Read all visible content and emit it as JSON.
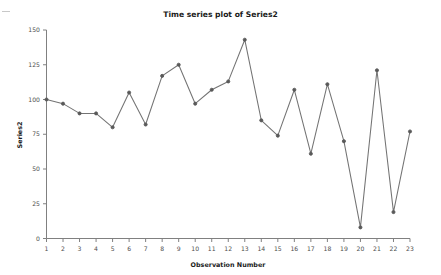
{
  "chart_data": {
    "type": "line",
    "title": "Time series plot of Series2",
    "xlabel": "Observation Number",
    "ylabel": "Series2",
    "x": [
      1,
      2,
      3,
      4,
      5,
      6,
      7,
      8,
      9,
      10,
      11,
      12,
      13,
      14,
      15,
      16,
      17,
      18,
      19,
      20,
      21,
      22,
      23
    ],
    "values": [
      100,
      97,
      90,
      90,
      80,
      105,
      82,
      117,
      125,
      97,
      107,
      113,
      143,
      85,
      74,
      107,
      61,
      111,
      70,
      8,
      121,
      19,
      77
    ],
    "series": [
      {
        "name": "Series2",
        "values": [
          100,
          97,
          90,
          90,
          80,
          105,
          82,
          117,
          125,
          97,
          107,
          113,
          143,
          85,
          74,
          107,
          61,
          111,
          70,
          8,
          121,
          19,
          77
        ]
      }
    ],
    "categories": [
      "1",
      "2",
      "3",
      "4",
      "5",
      "6",
      "7",
      "8",
      "9",
      "10",
      "11",
      "12",
      "13",
      "14",
      "15",
      "16",
      "17",
      "18",
      "19",
      "20",
      "21",
      "22",
      "23"
    ],
    "xlim": [
      1,
      23
    ],
    "ylim": [
      0,
      150
    ],
    "ytick_values": [
      0,
      25,
      50,
      75,
      100,
      125,
      150
    ],
    "ytick_labels": [
      "0",
      "25",
      "50",
      "75",
      "100",
      "125",
      "150"
    ],
    "xtick_labels": [
      "1",
      "2",
      "3",
      "4",
      "5",
      "6",
      "7",
      "8",
      "9",
      "10",
      "11",
      "12",
      "13",
      "14",
      "15",
      "16",
      "17",
      "18",
      "19",
      "20",
      "21",
      "22",
      "23"
    ],
    "grid": false,
    "legend": false,
    "legend_position": "none",
    "marker": "circle",
    "line_color": "#737373",
    "marker_color": "#595959",
    "background_color": "#ffffff",
    "axis_color": "#808080"
  }
}
